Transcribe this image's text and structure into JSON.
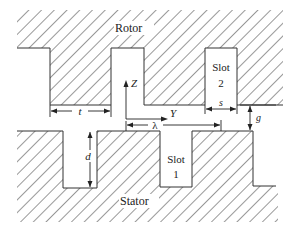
{
  "diagram": {
    "regions": {
      "rotor_label": "Rotor",
      "stator_label": "Stator",
      "slot2_line1": "Slot",
      "slot2_line2": "2",
      "slot1_line1": "Slot",
      "slot1_line2": "1"
    },
    "dimensions": {
      "tooth_width": "t",
      "slot_width": "s",
      "air_gap": "g",
      "slot_depth": "d",
      "pitch": "λ"
    },
    "axes": {
      "vertical": "Z",
      "horizontal": "Y"
    },
    "colors": {
      "stroke": "#333333",
      "hatch": "#444444",
      "background": "#ffffff"
    }
  }
}
